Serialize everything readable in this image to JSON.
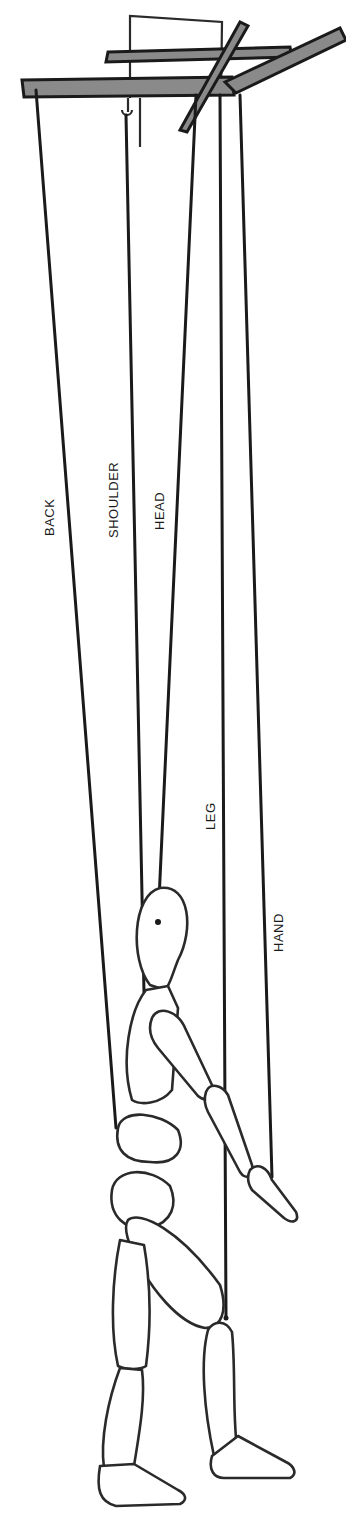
{
  "diagram": {
    "labels": {
      "back": "BACK",
      "shoulder": "SHOULDER",
      "head": "HEAD",
      "leg": "LEG",
      "hand": "HAND"
    },
    "colors": {
      "ink": "#1a1a1a",
      "background": "#ffffff",
      "bar_fill": "#8a8a8a"
    }
  }
}
